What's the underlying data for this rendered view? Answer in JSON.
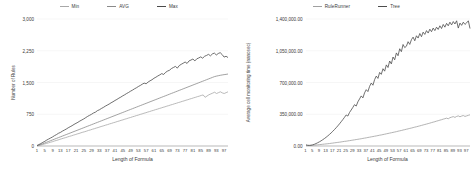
{
  "chart_data": [
    {
      "type": "line",
      "panel": "left",
      "title": "",
      "xlabel": "Length of Formula",
      "ylabel": "Number of Rules",
      "xlim": [
        1,
        99
      ],
      "ylim": [
        0,
        3000
      ],
      "grid": true,
      "legend_position": "top",
      "yticks": [
        "0",
        "750",
        "1,500",
        "2,250",
        "3,000"
      ],
      "ytick_values": [
        0,
        750,
        1500,
        2250,
        3000
      ],
      "xticks": [
        "1",
        "5",
        "9",
        "13",
        "17",
        "21",
        "25",
        "29",
        "33",
        "37",
        "41",
        "45",
        "49",
        "53",
        "57",
        "61",
        "65",
        "69",
        "73",
        "77",
        "81",
        "85",
        "89",
        "93",
        "97"
      ],
      "xtick_values": [
        1,
        5,
        9,
        13,
        17,
        21,
        25,
        29,
        33,
        37,
        41,
        45,
        49,
        53,
        57,
        61,
        65,
        69,
        73,
        77,
        81,
        85,
        89,
        93,
        97
      ],
      "series": [
        {
          "name": "Min",
          "color": "#a8a8a8",
          "values": [
            5,
            12,
            22,
            34,
            48,
            60,
            74,
            88,
            100,
            116,
            130,
            142,
            158,
            172,
            186,
            198,
            214,
            228,
            240,
            256,
            268,
            284,
            296,
            312,
            326,
            338,
            352,
            368,
            380,
            396,
            408,
            424,
            436,
            452,
            466,
            478,
            494,
            506,
            522,
            534,
            550,
            562,
            578,
            590,
            606,
            618,
            634,
            646,
            662,
            674,
            690,
            702,
            718,
            730,
            746,
            758,
            774,
            786,
            802,
            814,
            830,
            842,
            858,
            870,
            886,
            898,
            914,
            926,
            942,
            954,
            970,
            982,
            998,
            1010,
            1026,
            1038,
            1054,
            1066,
            1082,
            1094,
            1110,
            1122,
            1138,
            1150,
            1166,
            1178,
            1194,
            1206,
            1150,
            1180,
            1210,
            1230,
            1250,
            1270,
            1240,
            1260,
            1280,
            1255,
            1240,
            1260,
            1280
          ]
        },
        {
          "name": "AVG",
          "color": "#8a8a8a",
          "values": [
            8,
            20,
            36,
            54,
            72,
            90,
            108,
            126,
            144,
            162,
            180,
            198,
            216,
            234,
            252,
            270,
            288,
            306,
            324,
            342,
            360,
            378,
            396,
            414,
            432,
            450,
            468,
            486,
            504,
            522,
            540,
            558,
            576,
            594,
            612,
            630,
            648,
            666,
            684,
            702,
            720,
            738,
            756,
            774,
            792,
            810,
            828,
            846,
            864,
            882,
            900,
            918,
            936,
            954,
            972,
            990,
            1008,
            1026,
            1044,
            1062,
            1080,
            1098,
            1116,
            1134,
            1152,
            1170,
            1188,
            1206,
            1224,
            1242,
            1260,
            1278,
            1296,
            1314,
            1332,
            1350,
            1368,
            1386,
            1404,
            1422,
            1440,
            1458,
            1476,
            1494,
            1512,
            1530,
            1548,
            1566,
            1584,
            1602,
            1620,
            1638,
            1650,
            1660,
            1670,
            1678,
            1686,
            1692,
            1700
          ]
        },
        {
          "name": "Max",
          "color": "#4a4a4a",
          "values": [
            12,
            34,
            58,
            86,
            110,
            140,
            165,
            190,
            215,
            245,
            270,
            300,
            320,
            350,
            375,
            400,
            430,
            455,
            480,
            510,
            535,
            560,
            590,
            615,
            640,
            670,
            700,
            725,
            750,
            780,
            800,
            835,
            855,
            885,
            910,
            940,
            965,
            990,
            1020,
            1045,
            1075,
            1100,
            1130,
            1155,
            1185,
            1210,
            1240,
            1265,
            1295,
            1320,
            1350,
            1375,
            1405,
            1430,
            1460,
            1485,
            1470,
            1510,
            1540,
            1565,
            1600,
            1625,
            1655,
            1680,
            1710,
            1690,
            1740,
            1770,
            1790,
            1830,
            1855,
            1880,
            1840,
            1900,
            1930,
            1955,
            1985,
            1950,
            2010,
            2030,
            2055,
            2010,
            2060,
            2080,
            2105,
            2075,
            2120,
            2140,
            2165,
            2130,
            2175,
            2195,
            2150,
            2185,
            2205,
            2160,
            2100,
            2120,
            2090
          ]
        }
      ]
    },
    {
      "type": "line",
      "panel": "right",
      "title": "",
      "xlabel": "Length of Formula",
      "ylabel": "Average cell monitoring time (nanosec)",
      "xlim": [
        1,
        99
      ],
      "ylim": [
        0,
        1400000
      ],
      "grid": true,
      "legend_position": "top",
      "yticks": [
        "0.00",
        "350,000.00",
        "700,000.00",
        "1,050,000.00",
        "1,400,000.00"
      ],
      "ytick_values": [
        0,
        350000,
        700000,
        1050000,
        1400000
      ],
      "xticks": [
        "1",
        "5",
        "9",
        "13",
        "17",
        "21",
        "25",
        "29",
        "33",
        "37",
        "41",
        "45",
        "49",
        "53",
        "57",
        "61",
        "65",
        "69",
        "73",
        "77",
        "81",
        "85",
        "89",
        "93",
        "97"
      ],
      "xtick_values": [
        1,
        5,
        9,
        13,
        17,
        21,
        25,
        29,
        33,
        37,
        41,
        45,
        49,
        53,
        57,
        61,
        65,
        69,
        73,
        77,
        81,
        85,
        89,
        93,
        97
      ],
      "series": [
        {
          "name": "RuleRunner",
          "color": "#a0a0a0",
          "values": [
            9000,
            6000,
            5000,
            5500,
            7000,
            9000,
            11000,
            13000,
            15000,
            17000,
            19000,
            21000,
            23000,
            25000,
            27000,
            30000,
            32000,
            35000,
            37000,
            40000,
            42000,
            45000,
            48000,
            51000,
            53000,
            56000,
            59000,
            62000,
            65000,
            68000,
            71000,
            74000,
            77000,
            80000,
            84000,
            87000,
            90000,
            94000,
            97000,
            101000,
            104000,
            108000,
            111000,
            115000,
            119000,
            122000,
            126000,
            130000,
            134000,
            138000,
            142000,
            146000,
            150000,
            154000,
            158000,
            163000,
            167000,
            171000,
            176000,
            180000,
            185000,
            189000,
            194000,
            198000,
            203000,
            208000,
            212000,
            217000,
            222000,
            227000,
            232000,
            237000,
            242000,
            247000,
            252000,
            258000,
            263000,
            268000,
            274000,
            279000,
            285000,
            290000,
            296000,
            301000,
            307000,
            300000,
            312000,
            318000,
            324000,
            315000,
            326000,
            332000,
            322000,
            330000,
            336000,
            326000,
            332000,
            338000,
            344000
          ]
        },
        {
          "name": "Tree",
          "color": "#4d4d4d",
          "values": [
            12000,
            8000,
            7000,
            9000,
            13000,
            19000,
            27000,
            36000,
            46000,
            57000,
            69000,
            82000,
            96000,
            111000,
            127000,
            144000,
            162000,
            181000,
            201000,
            222000,
            244000,
            267000,
            291000,
            316000,
            342000,
            330000,
            369000,
            397000,
            426000,
            456000,
            440000,
            487000,
            519000,
            552000,
            530000,
            586000,
            621000,
            600000,
            657000,
            694000,
            670000,
            732000,
            771000,
            745000,
            811000,
            790000,
            852000,
            825000,
            894000,
            865000,
            937000,
            905000,
            981000,
            950000,
            1026000,
            995000,
            1072000,
            1040000,
            1119000,
            1085000,
            1100000,
            1150000,
            1120000,
            1172000,
            1200000,
            1160000,
            1215000,
            1190000,
            1240000,
            1205000,
            1255000,
            1230000,
            1272000,
            1245000,
            1288000,
            1260000,
            1300000,
            1272000,
            1310000,
            1285000,
            1325000,
            1295000,
            1340000,
            1310000,
            1352000,
            1325000,
            1365000,
            1335000,
            1372000,
            1345000,
            1380000,
            1300000,
            1355000,
            1330000,
            1365000,
            1340000,
            1358000,
            1380000,
            1295000
          ]
        }
      ]
    }
  ]
}
